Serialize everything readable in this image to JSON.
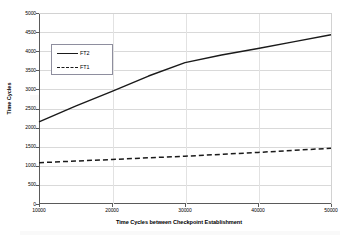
{
  "chart_data": {
    "type": "line",
    "title": "",
    "xlabel": "Time Cycles between Checkpoint Establishment",
    "ylabel": "Time Cycles",
    "xlim": [
      10000,
      50000
    ],
    "ylim": [
      0,
      5000
    ],
    "grid": true,
    "legend_position": "upper-left-inside",
    "xticks": [
      "10000",
      "20000",
      "30000",
      "40000",
      "50000"
    ],
    "yticks": [
      "0",
      "500",
      "1000",
      "1500",
      "2000",
      "2500",
      "3000",
      "3500",
      "4000",
      "4500",
      "5000"
    ],
    "xtick_values": [
      10000,
      20000,
      30000,
      40000,
      50000
    ],
    "ytick_values": [
      0,
      500,
      1000,
      1500,
      2000,
      2500,
      3000,
      3500,
      4000,
      4500,
      5000
    ],
    "x": [
      10000,
      15000,
      20000,
      25000,
      30000,
      35000,
      40000,
      45000,
      50000
    ],
    "series": [
      {
        "name": "FT2",
        "style": "solid",
        "color": "#1a1a1a",
        "values": [
          2150,
          2560,
          2950,
          3350,
          3700,
          3900,
          4070,
          4250,
          4430
        ]
      },
      {
        "name": "FT1",
        "style": "dashed",
        "color": "#1a1a1a",
        "values": [
          1080,
          1125,
          1165,
          1210,
          1250,
          1300,
          1350,
          1405,
          1460
        ]
      }
    ]
  },
  "legend": {
    "entries": [
      {
        "label": "FT2",
        "style": "solid"
      },
      {
        "label": "FT1",
        "style": "dashed"
      }
    ]
  },
  "axes": {
    "x_title": "Time Cycles between Checkpoint Establishment",
    "y_title": "Time Cycles"
  },
  "colors": {
    "line": "#1a1a1a",
    "grid": "#d9d9d9",
    "axis": "#5a5a5a",
    "legend_border": "#8e8e9e",
    "background": "#ffffff"
  }
}
